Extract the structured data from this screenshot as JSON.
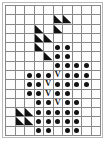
{
  "figure": {
    "title": "",
    "type": "pattern-grid",
    "columns": 10,
    "rows": 14,
    "colors": {
      "grid_line": "#888888",
      "mark": "#111111",
      "background": "#ffffff",
      "frame": "#b8b8b8"
    },
    "legend": {
      "dot": "filled-circle",
      "vee": "V",
      "triangle": "filled-lower-left-triangle",
      "empty": ""
    },
    "glyphs": {
      "vee_label": "V"
    },
    "cells": [
      [
        "",
        "",
        "",
        "",
        "",
        "",
        "",
        "",
        "",
        ""
      ],
      [
        "",
        "",
        "",
        "",
        "",
        "tri",
        "tri",
        "",
        "",
        ""
      ],
      [
        "",
        "",
        "",
        "tri",
        "",
        "tri",
        "",
        "",
        "",
        ""
      ],
      [
        "",
        "",
        "",
        "tri",
        "tri",
        "",
        "",
        "",
        "",
        ""
      ],
      [
        "",
        "",
        "",
        "tri",
        "",
        "dot",
        "dot",
        "",
        "",
        ""
      ],
      [
        "",
        "",
        "",
        "",
        "tri",
        "dot",
        "dot",
        "",
        "",
        ""
      ],
      [
        "",
        "",
        "",
        "",
        "",
        "dot",
        "dot",
        "dot",
        "dot",
        ""
      ],
      [
        "",
        "",
        "dot",
        "dot",
        "dot",
        "vee",
        "dot",
        "dot",
        "dot",
        ""
      ],
      [
        "",
        "",
        "dot",
        "dot",
        "vee",
        "dot",
        "dot",
        "dot",
        "dot",
        ""
      ],
      [
        "",
        "",
        "dot",
        "dot",
        "vee",
        "dot",
        "dot",
        "",
        "",
        ""
      ],
      [
        "",
        "",
        "",
        "dot",
        "dot",
        "vee",
        "dot",
        "dot",
        "",
        ""
      ],
      [
        "",
        "tri",
        "tri",
        "dot",
        "dot",
        "dot",
        "dot",
        "dot",
        "",
        ""
      ],
      [
        "",
        "tri",
        "tri",
        "dot",
        "dot",
        "dot",
        "dot",
        "dot",
        "",
        ""
      ],
      [
        "",
        "",
        "",
        "dot",
        "dot",
        "",
        "dot",
        "dot",
        "",
        ""
      ]
    ]
  }
}
